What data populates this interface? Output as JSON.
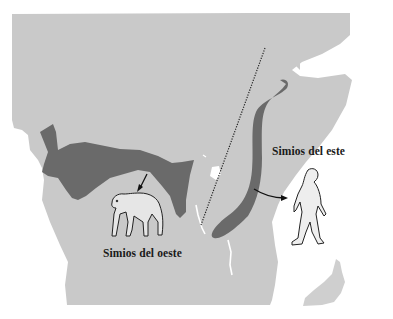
{
  "diagram": {
    "type": "map",
    "region": "Africa (centro y este)",
    "colors": {
      "background": "#ffffff",
      "land": "#c9c9c9",
      "range": "#6a6a6a",
      "water": "#ffffff",
      "divider": "#222222",
      "text": "#1a1a1a"
    },
    "labels": {
      "west": "Simios del oeste",
      "east": "Simios del este"
    },
    "legend_items": [
      {
        "name": "west-apes-range",
        "label": "Simios del oeste",
        "figure": "chimpanzee-quadruped"
      },
      {
        "name": "east-apes-range",
        "label": "Simios del este",
        "figure": "hominid-bipedal"
      }
    ],
    "divider": {
      "style": "dotted",
      "description": "Rift Valley line"
    }
  }
}
